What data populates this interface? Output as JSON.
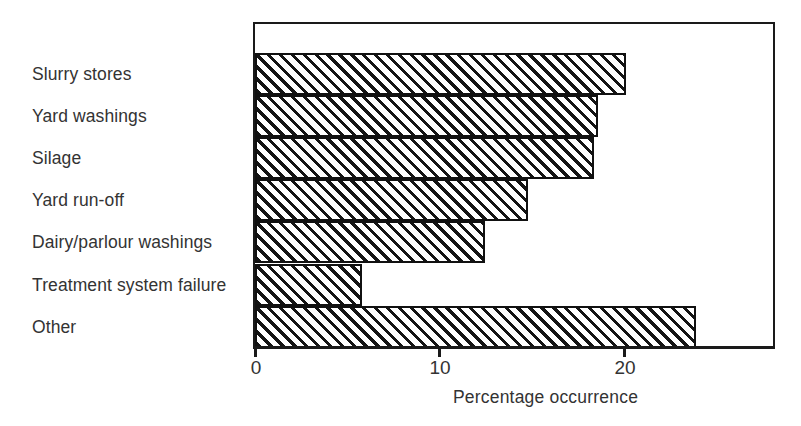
{
  "chart_data": {
    "type": "bar",
    "orientation": "horizontal",
    "title": "",
    "subtitle": "",
    "xlabel": "Percentage occurrence",
    "ylabel": "",
    "categories": [
      "Slurry stores",
      "Yard washings",
      "Silage",
      "Yard run-off",
      "Dairy/parlour washings",
      "Treatment system failure",
      "Other"
    ],
    "values": [
      20.1,
      18.6,
      18.4,
      14.8,
      12.5,
      5.8,
      4.0
    ],
    "series": [
      {
        "name": "Percentage occurrence",
        "values": [
          20.1,
          18.6,
          18.4,
          14.8,
          12.5,
          5.8,
          4.0
        ]
      }
    ],
    "bar_order_top_to_bottom": [
      {
        "category": "Slurry stores",
        "value": 20.1
      },
      {
        "category": "Yard washings",
        "value": 18.6
      },
      {
        "category": "Silage",
        "value": 18.4
      },
      {
        "category": "Yard run-off",
        "value": 14.8
      },
      {
        "category": "Dairy/parlour washings",
        "value": 12.5
      },
      {
        "category": "Treatment system failure",
        "value": 5.8
      },
      {
        "category": "Other",
        "value": 23.9
      }
    ],
    "xlim": [
      0,
      28.1
    ],
    "ylim": null,
    "xticks": [
      0,
      10,
      20
    ],
    "xticklabels": [
      "0",
      "10",
      "20"
    ],
    "grid": false,
    "legend": false,
    "legend_position": "none",
    "bar_style": {
      "fill": "diagonal-hatch",
      "hatch_direction": "forward-slash",
      "edge_color": "#111111",
      "background_color": "#ffffff",
      "gap_between_bars": 0
    },
    "annotations": []
  },
  "labels": {
    "tick_0": "0",
    "tick_10": "10",
    "tick_20": "20",
    "axis_title": "Percentage occurrence"
  },
  "colors": {
    "background": "#ffffff",
    "ink": "#1a1a1a",
    "text": "#333333",
    "hatch": "#141414"
  }
}
